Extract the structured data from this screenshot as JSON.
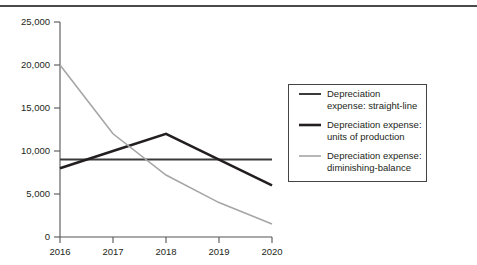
{
  "figure": {
    "name": "depreciation-expense-comparison-chart",
    "top_rule": true
  },
  "chart_data": {
    "type": "line",
    "title": "",
    "subtitle": "",
    "xlabel": "",
    "ylabel": "",
    "categories": [
      "2016",
      "2017",
      "2018",
      "2019",
      "2020"
    ],
    "x": [
      2016,
      2017,
      2018,
      2019,
      2020
    ],
    "ylim": [
      0,
      25000
    ],
    "xlim": [
      2016,
      2020
    ],
    "yticks": [
      0,
      5000,
      10000,
      15000,
      20000,
      25000
    ],
    "ytick_labels": [
      "0",
      "5,000",
      "10,000",
      "15,000",
      "20,000",
      "25,000"
    ],
    "xtick_labels": [
      "2016",
      "2017",
      "2018",
      "2019",
      "2020"
    ],
    "grid": false,
    "legend_position": "right",
    "series": [
      {
        "name": "Depreciation expense: straight-line",
        "legend_line1": "Depreciation",
        "legend_line2": "expense: straight-line",
        "color": "#3a3a3a",
        "width": 2.0,
        "values": [
          9000,
          9000,
          9000,
          9000,
          9000
        ]
      },
      {
        "name": "Depreciation expense: units of production",
        "legend_line1": "Depreciation expense:",
        "legend_line2": "units of production",
        "color": "#231f20",
        "width": 2.6,
        "values": [
          8000,
          10000,
          12000,
          9000,
          6000
        ]
      },
      {
        "name": "Depreciation expense: diminishing-balance",
        "legend_line1": "Depreciation expense:",
        "legend_line2": "diminishing-balance",
        "color": "#a6a6a6",
        "width": 1.6,
        "values": [
          20000,
          12000,
          7200,
          4000,
          1500
        ]
      }
    ]
  },
  "legend": {
    "border_color": "#444444",
    "background": "#ffffff",
    "entries": [
      {
        "line1": "Depreciation",
        "line2": "expense: straight-line",
        "swatch": "straight-line-swatch"
      },
      {
        "line1": "Depreciation expense:",
        "line2": "units of production",
        "swatch": "units-of-production-swatch"
      },
      {
        "line1": "Depreciation expense:",
        "line2": "diminishing-balance",
        "swatch": "diminishing-balance-swatch"
      }
    ]
  },
  "axes": {
    "axis_color": "#555555",
    "y_axis_name": "y-axis",
    "x_axis_name": "x-axis"
  }
}
